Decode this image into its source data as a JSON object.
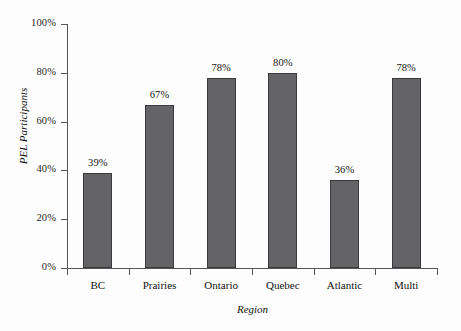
{
  "chart_data": {
    "type": "bar",
    "title": "",
    "xlabel": "Region",
    "ylabel": "PEL Participants",
    "categories": [
      "BC",
      "Prairies",
      "Ontario",
      "Quebec",
      "Atlantic",
      "Multi"
    ],
    "values": [
      39,
      67,
      78,
      80,
      36,
      78
    ],
    "value_labels": [
      "39%",
      "67%",
      "78%",
      "80%",
      "36%",
      "78%"
    ],
    "ylim": [
      0,
      100
    ],
    "y_ticks": [
      0,
      20,
      40,
      60,
      80,
      100
    ],
    "y_tick_labels": [
      "0%",
      "20%",
      "40%",
      "60%",
      "80%",
      "100%"
    ],
    "grid": false,
    "legend": "none",
    "bar_color": "#646466",
    "bar_border_color": "#3a3a3c",
    "axis_color": "#55555a",
    "background_color": "#fdfdfd"
  }
}
